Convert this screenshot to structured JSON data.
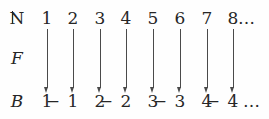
{
  "figure": {
    "type": "mapping-diagram",
    "background_color": "#fefefe",
    "text_color": "#262626",
    "arrow_color": "#4a4a4a"
  },
  "labels": {
    "domain": "ℕ",
    "domain_plain": "N",
    "function": "F",
    "codomain": "B"
  },
  "ellipsis": {
    "top": "…",
    "bottom": "…"
  },
  "chart_data": {
    "type": "diagram",
    "title": "",
    "domain_label": "ℕ",
    "function_label": "F",
    "codomain_label": "B",
    "mappings": [
      {
        "from": "1",
        "to": "1",
        "to_sign": "",
        "to_digit": "1"
      },
      {
        "from": "2",
        "to": "−1",
        "to_sign": "−",
        "to_digit": "1"
      },
      {
        "from": "3",
        "to": "2",
        "to_sign": "",
        "to_digit": "2"
      },
      {
        "from": "4",
        "to": "−2",
        "to_sign": "−",
        "to_digit": "2"
      },
      {
        "from": "5",
        "to": "3",
        "to_sign": "",
        "to_digit": "3"
      },
      {
        "from": "6",
        "to": "−3",
        "to_sign": "−",
        "to_digit": "3"
      },
      {
        "from": "7",
        "to": "4",
        "to_sign": "",
        "to_digit": "4"
      },
      {
        "from": "8",
        "to": "−4",
        "to_sign": "−",
        "to_digit": "4"
      }
    ]
  },
  "columns": [
    {
      "x": 32,
      "top": "1",
      "sign": "",
      "digit": "1"
    },
    {
      "x": 58,
      "top": "2",
      "sign": "−",
      "digit": "1"
    },
    {
      "x": 85,
      "top": "3",
      "sign": "",
      "digit": "2"
    },
    {
      "x": 111,
      "top": "4",
      "sign": "−",
      "digit": "2"
    },
    {
      "x": 138,
      "top": "5",
      "sign": "",
      "digit": "3"
    },
    {
      "x": 165,
      "top": "6",
      "sign": "−",
      "digit": "3"
    },
    {
      "x": 192,
      "top": "7",
      "sign": "",
      "digit": "4"
    },
    {
      "x": 218,
      "top": "8",
      "sign": "−",
      "digit": "4"
    }
  ]
}
